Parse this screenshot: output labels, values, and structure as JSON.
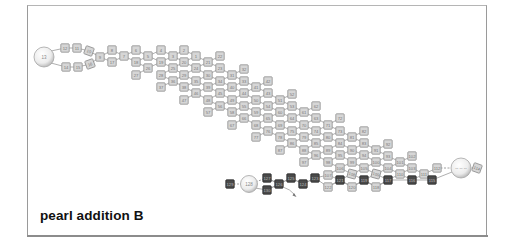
{
  "caption": "pearl addition B",
  "colors": {
    "frame_border": "#9a9a9a",
    "bead_light_fill": "#d6d6d6",
    "bead_light_stroke": "#8e8e8e",
    "bead_dark_fill": "#4a4a4a",
    "sphere_fill": "#f2f2f2",
    "link": "#9a9a9a"
  },
  "spheres": [
    {
      "id": "sphere-left",
      "label": "13",
      "cx": 44,
      "cy": 57,
      "r": 10
    },
    {
      "id": "sphere-right",
      "label": "-- -- --",
      "cx": 461,
      "cy": 168,
      "r": 10
    },
    {
      "id": "sphere-bottom",
      "label": "128",
      "cx": 249,
      "cy": 184,
      "r": 8.5
    }
  ],
  "beads": [
    {
      "label": "12",
      "x": 65,
      "y": 48
    },
    {
      "label": "11",
      "x": 77,
      "y": 48
    },
    {
      "label": "10",
      "x": 89,
      "y": 51,
      "rot": 20
    },
    {
      "label": "14",
      "x": 66,
      "y": 67
    },
    {
      "label": "15",
      "x": 78,
      "y": 67
    },
    {
      "label": "16",
      "x": 90,
      "y": 64,
      "rot": -20
    },
    {
      "label": "9",
      "x": 100,
      "y": 57
    },
    {
      "label": "8",
      "x": 112,
      "y": 50
    },
    {
      "label": "17",
      "x": 112,
      "y": 62
    },
    {
      "label": "7",
      "x": 124,
      "y": 56
    },
    {
      "label": "6",
      "x": 136,
      "y": 50
    },
    {
      "label": "18",
      "x": 136,
      "y": 62
    },
    {
      "label": "27",
      "x": 136,
      "y": 75
    },
    {
      "label": "5",
      "x": 148,
      "y": 56
    },
    {
      "label": "26",
      "x": 148,
      "y": 68
    },
    {
      "label": "4",
      "x": 161,
      "y": 50
    },
    {
      "label": "19",
      "x": 161,
      "y": 62
    },
    {
      "label": "28",
      "x": 161,
      "y": 75
    },
    {
      "label": "37",
      "x": 161,
      "y": 87
    },
    {
      "label": "3",
      "x": 173,
      "y": 56
    },
    {
      "label": "25",
      "x": 173,
      "y": 68
    },
    {
      "label": "36",
      "x": 173,
      "y": 81
    },
    {
      "label": "2",
      "x": 184,
      "y": 50
    },
    {
      "label": "20",
      "x": 184,
      "y": 62
    },
    {
      "label": "29",
      "x": 184,
      "y": 75
    },
    {
      "label": "38",
      "x": 184,
      "y": 87
    },
    {
      "label": "47",
      "x": 184,
      "y": 100
    },
    {
      "label": "1",
      "x": 196,
      "y": 56
    },
    {
      "label": "24",
      "x": 196,
      "y": 68
    },
    {
      "label": "35",
      "x": 196,
      "y": 81
    },
    {
      "label": "46",
      "x": 196,
      "y": 93
    },
    {
      "label": "21",
      "x": 208,
      "y": 62
    },
    {
      "label": "30",
      "x": 208,
      "y": 75
    },
    {
      "label": "39",
      "x": 208,
      "y": 87
    },
    {
      "label": "48",
      "x": 208,
      "y": 100
    },
    {
      "label": "57",
      "x": 208,
      "y": 112
    },
    {
      "label": "22",
      "x": 220,
      "y": 56
    },
    {
      "label": "23",
      "x": 220,
      "y": 68
    },
    {
      "label": "34",
      "x": 220,
      "y": 81
    },
    {
      "label": "45",
      "x": 220,
      "y": 93
    },
    {
      "label": "56",
      "x": 220,
      "y": 106
    },
    {
      "label": "31",
      "x": 232,
      "y": 75
    },
    {
      "label": "40",
      "x": 232,
      "y": 87
    },
    {
      "label": "49",
      "x": 232,
      "y": 100
    },
    {
      "label": "58",
      "x": 232,
      "y": 112
    },
    {
      "label": "67",
      "x": 232,
      "y": 125
    },
    {
      "label": "32",
      "x": 244,
      "y": 69
    },
    {
      "label": "33",
      "x": 244,
      "y": 81
    },
    {
      "label": "44",
      "x": 244,
      "y": 93
    },
    {
      "label": "55",
      "x": 244,
      "y": 106
    },
    {
      "label": "66",
      "x": 244,
      "y": 118
    },
    {
      "label": "41",
      "x": 256,
      "y": 87
    },
    {
      "label": "50",
      "x": 256,
      "y": 100
    },
    {
      "label": "59",
      "x": 256,
      "y": 112
    },
    {
      "label": "68",
      "x": 256,
      "y": 125
    },
    {
      "label": "77",
      "x": 256,
      "y": 137
    },
    {
      "label": "42",
      "x": 268,
      "y": 81
    },
    {
      "label": "43",
      "x": 268,
      "y": 93
    },
    {
      "label": "54",
      "x": 268,
      "y": 106
    },
    {
      "label": "65",
      "x": 268,
      "y": 118
    },
    {
      "label": "76",
      "x": 268,
      "y": 131
    },
    {
      "label": "51",
      "x": 280,
      "y": 100
    },
    {
      "label": "60",
      "x": 280,
      "y": 112
    },
    {
      "label": "69",
      "x": 280,
      "y": 125
    },
    {
      "label": "78",
      "x": 280,
      "y": 137
    },
    {
      "label": "87",
      "x": 280,
      "y": 150
    },
    {
      "label": "52",
      "x": 292,
      "y": 94
    },
    {
      "label": "53",
      "x": 292,
      "y": 106
    },
    {
      "label": "64",
      "x": 292,
      "y": 118
    },
    {
      "label": "75",
      "x": 292,
      "y": 131
    },
    {
      "label": "86",
      "x": 292,
      "y": 143
    },
    {
      "label": "61",
      "x": 304,
      "y": 112
    },
    {
      "label": "70",
      "x": 304,
      "y": 125
    },
    {
      "label": "79",
      "x": 304,
      "y": 137
    },
    {
      "label": "88",
      "x": 304,
      "y": 150
    },
    {
      "label": "97",
      "x": 304,
      "y": 162
    },
    {
      "label": "62",
      "x": 316,
      "y": 106
    },
    {
      "label": "63",
      "x": 316,
      "y": 118
    },
    {
      "label": "74",
      "x": 316,
      "y": 131
    },
    {
      "label": "85",
      "x": 316,
      "y": 143
    },
    {
      "label": "96",
      "x": 316,
      "y": 155
    },
    {
      "label": "71",
      "x": 328,
      "y": 125
    },
    {
      "label": "80",
      "x": 328,
      "y": 137
    },
    {
      "label": "89",
      "x": 328,
      "y": 150
    },
    {
      "label": "98",
      "x": 328,
      "y": 162
    },
    {
      "label": "107",
      "x": 328,
      "y": 175
    },
    {
      "label": "72",
      "x": 340,
      "y": 118
    },
    {
      "label": "73",
      "x": 340,
      "y": 131
    },
    {
      "label": "84",
      "x": 340,
      "y": 143
    },
    {
      "label": "95",
      "x": 340,
      "y": 155
    },
    {
      "label": "106",
      "x": 340,
      "y": 168
    },
    {
      "label": "81",
      "x": 352,
      "y": 137
    },
    {
      "label": "90",
      "x": 352,
      "y": 150
    },
    {
      "label": "99",
      "x": 352,
      "y": 162
    },
    {
      "label": "108",
      "x": 352,
      "y": 174,
      "rot": 15
    },
    {
      "label": "82",
      "x": 364,
      "y": 131
    },
    {
      "label": "83",
      "x": 364,
      "y": 143
    },
    {
      "label": "94",
      "x": 364,
      "y": 155
    },
    {
      "label": "105",
      "x": 364,
      "y": 168
    },
    {
      "label": "91",
      "x": 376,
      "y": 150
    },
    {
      "label": "100",
      "x": 376,
      "y": 162
    },
    {
      "label": "109",
      "x": 376,
      "y": 174,
      "rot": 15
    },
    {
      "label": "92",
      "x": 388,
      "y": 144
    },
    {
      "label": "93",
      "x": 388,
      "y": 156
    },
    {
      "label": "104",
      "x": 388,
      "y": 168
    },
    {
      "label": "101",
      "x": 400,
      "y": 162
    },
    {
      "label": "110",
      "x": 400,
      "y": 174
    },
    {
      "label": "102",
      "x": 412,
      "y": 156
    },
    {
      "label": "103",
      "x": 412,
      "y": 168
    },
    {
      "label": "111",
      "x": 424,
      "y": 174
    },
    {
      "label": "112",
      "x": 437,
      "y": 168
    },
    {
      "label": "114",
      "x": 477,
      "y": 168,
      "rot": 20
    },
    {
      "label": "129",
      "x": 230,
      "y": 184,
      "dark": true
    },
    {
      "label": "127",
      "x": 267,
      "y": 178,
      "dark": true
    },
    {
      "label": "130",
      "x": 267,
      "y": 190,
      "dark": true
    },
    {
      "label": "126",
      "x": 279,
      "y": 184,
      "dark": true
    },
    {
      "label": "125",
      "x": 291,
      "y": 178,
      "dark": true
    },
    {
      "label": "124",
      "x": 303,
      "y": 184,
      "dark": true
    },
    {
      "label": "123",
      "x": 315,
      "y": 178,
      "dark": true
    },
    {
      "label": "122",
      "x": 328,
      "y": 187,
      "dark": false
    },
    {
      "label": "121",
      "x": 340,
      "y": 180,
      "dark": true
    },
    {
      "label": "120",
      "x": 352,
      "y": 187,
      "dark": false
    },
    {
      "label": "119",
      "x": 364,
      "y": 180,
      "dark": true
    },
    {
      "label": "118",
      "x": 376,
      "y": 187,
      "dark": false
    },
    {
      "label": "117",
      "x": 388,
      "y": 180,
      "dark": true
    },
    {
      "label": "116",
      "x": 412,
      "y": 180,
      "dark": true
    },
    {
      "label": "115",
      "x": 432,
      "y": 180,
      "dark": true
    }
  ]
}
